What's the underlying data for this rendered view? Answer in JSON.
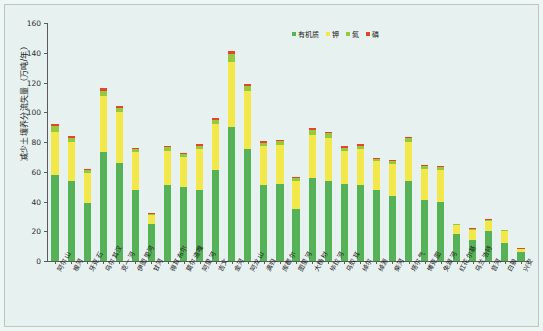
{
  "chart_data": {
    "type": "bar",
    "stacked": true,
    "title": "",
    "xlabel": "",
    "ylabel": "减少土壤养分流失量（万吨/年）",
    "ylim": [
      0,
      160
    ],
    "yticks": [
      0,
      20,
      40,
      60,
      80,
      100,
      120,
      140,
      160
    ],
    "grid": false,
    "legend_position": "top-right",
    "categories": [
      "阿尔山",
      "根河",
      "牙克石",
      "乌尔其汉",
      "克一河",
      "伊图里河",
      "甘河",
      "得耳布尔",
      "莫尔道嘎",
      "阿里河",
      "吉文",
      "金河",
      "阿龙山",
      "满归",
      "库都尔",
      "图里河",
      "大杨树",
      "毕拉河",
      "乌奴耳",
      "绰尔",
      "绰源",
      "柴河",
      "塔尔气",
      "博克图",
      "免渡河",
      "红花尔基",
      "乌兰浩特",
      "音河",
      "白狼",
      "兴安"
    ],
    "series": [
      {
        "name": "有机质",
        "color": "#56b257",
        "values": [
          58,
          54,
          39,
          73,
          66,
          48,
          25,
          51,
          50,
          48,
          61,
          90,
          75,
          51,
          52,
          35,
          56,
          54,
          52,
          51,
          48,
          44,
          54,
          41,
          40,
          18,
          14,
          20,
          12,
          6
        ]
      },
      {
        "name": "钾",
        "color": "#f2e84a",
        "values": [
          29,
          26,
          20,
          38,
          34,
          25,
          6,
          23,
          20,
          27,
          31,
          44,
          39,
          26,
          26,
          19,
          29,
          29,
          22,
          24,
          19,
          21,
          26,
          21,
          21,
          6,
          7,
          7,
          8,
          2
        ]
      },
      {
        "name": "氮",
        "color": "#96c93d",
        "values": [
          3.5,
          3.0,
          2.0,
          3.5,
          2.8,
          2.2,
          0.8,
          2.4,
          2.0,
          2.4,
          3.0,
          5.0,
          3.5,
          2.5,
          2.4,
          1.8,
          3.0,
          2.8,
          2.2,
          2.4,
          1.8,
          2.0,
          2.4,
          2.0,
          2.0,
          0.8,
          0.8,
          0.8,
          0.8,
          0.4
        ]
      },
      {
        "name": "磷",
        "color": "#e8442a",
        "values": [
          1.5,
          1.2,
          0.8,
          1.5,
          1.2,
          0.9,
          0.3,
          1.0,
          0.8,
          1.0,
          1.2,
          2.0,
          1.5,
          1.0,
          1.0,
          0.7,
          1.2,
          1.2,
          0.9,
          1.0,
          0.7,
          0.8,
          1.0,
          0.8,
          0.8,
          0.3,
          0.3,
          0.3,
          0.3,
          0.2
        ]
      }
    ]
  }
}
